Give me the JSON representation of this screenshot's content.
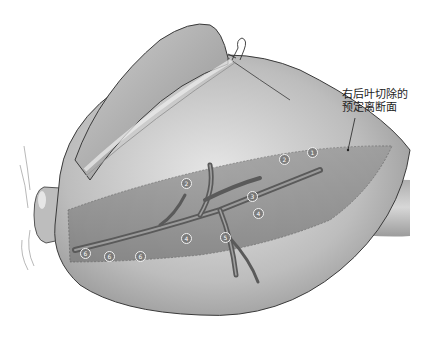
{
  "figure": {
    "annotation": {
      "line1": "右后叶切除的",
      "line2": "预定离断面"
    },
    "markers": [
      {
        "label": "1",
        "x": 312,
        "y": 152
      },
      {
        "label": "2",
        "x": 284,
        "y": 159
      },
      {
        "label": "2",
        "x": 186,
        "y": 183
      },
      {
        "label": "3",
        "x": 252,
        "y": 196
      },
      {
        "label": "4",
        "x": 258,
        "y": 213
      },
      {
        "label": "4",
        "x": 186,
        "y": 238
      },
      {
        "label": "5",
        "x": 225,
        "y": 237
      },
      {
        "label": "6",
        "x": 85,
        "y": 253
      },
      {
        "label": "6",
        "x": 109,
        "y": 256
      },
      {
        "label": "6",
        "x": 140,
        "y": 256
      }
    ],
    "colors": {
      "organ_light": "#d9d9d9",
      "organ_mid": "#a8a8a8",
      "organ_dark": "#6e6e6e",
      "plane_band": "#8f8f8f",
      "vessel": "#5a5a5a",
      "outline": "#3a3a3a"
    }
  }
}
